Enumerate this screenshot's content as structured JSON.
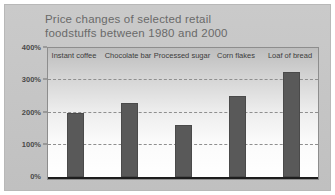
{
  "chart_data": {
    "type": "bar",
    "title": "Price changes of selected retail\nfoodstuffs between 1980 and 2000",
    "xlabel": "",
    "ylabel": "",
    "ylim": [
      0,
      400
    ],
    "grid": true,
    "legend": "none",
    "categories": [
      "Instant coffee",
      "Chocolate bar",
      "Processed sugar",
      "Corn flakes",
      "Loaf of bread"
    ],
    "values": [
      200,
      230,
      160,
      250,
      325
    ],
    "ytick_labels": [
      "0%",
      "100%",
      "200%",
      "300%",
      "400%"
    ],
    "ytick_values": [
      0,
      100,
      200,
      300,
      400
    ],
    "bar_color": "#595959",
    "grid_color": "#8f8f8f",
    "panel_color": "#c6c6c6"
  }
}
